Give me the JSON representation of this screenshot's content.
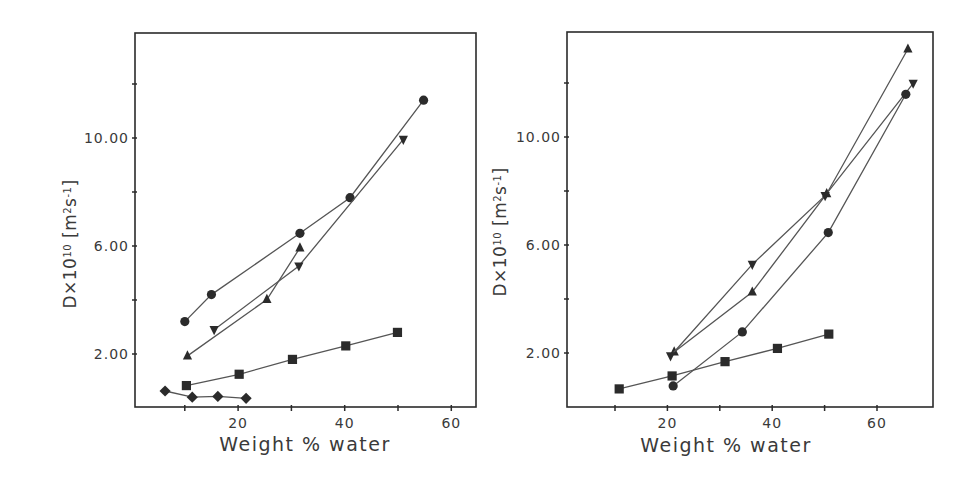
{
  "figure": {
    "panels": [
      "left",
      "right"
    ]
  },
  "chart_data": [
    {
      "type": "line",
      "panel": "left",
      "title": "",
      "xlabel": "Weight % water",
      "ylabel": "D×10^10 [m^2 s^-1]",
      "ylabel_parts": {
        "base": "D×10",
        "exp": "10",
        "unit_open": "[m",
        "unit_exp1": "2",
        "unit_mid": "s",
        "unit_exp2": "-1",
        "unit_close": "]"
      },
      "xlim": [
        0,
        65
      ],
      "ylim": [
        0,
        14
      ],
      "x_ticks": [
        10,
        20,
        30,
        40,
        50,
        60
      ],
      "x_tick_labels": [
        "",
        "20",
        "",
        "40",
        "",
        "60"
      ],
      "y_ticks": [
        2,
        4,
        6,
        8,
        10,
        12
      ],
      "y_tick_labels": [
        "2.00",
        "",
        "6.00",
        "",
        "10.00",
        ""
      ],
      "grid": false,
      "legend": null,
      "series": [
        {
          "name": "circle",
          "marker": "circle",
          "x": [
            10.0,
            15.0,
            31.6,
            41.0,
            54.8
          ],
          "y": [
            3.2,
            4.2,
            6.47,
            7.79,
            11.4
          ]
        },
        {
          "name": "triangle-down",
          "marker": "triangle-down",
          "x": [
            15.5,
            31.4,
            51.0
          ],
          "y": [
            2.9,
            5.26,
            9.95
          ]
        },
        {
          "name": "triangle-up",
          "marker": "triangle-up",
          "x": [
            10.5,
            25.4,
            31.6
          ],
          "y": [
            1.93,
            4.02,
            5.93
          ]
        },
        {
          "name": "square",
          "marker": "square",
          "x": [
            10.3,
            20.2,
            30.2,
            40.2,
            49.9
          ],
          "y": [
            0.83,
            1.25,
            1.8,
            2.3,
            2.8
          ]
        },
        {
          "name": "diamond",
          "marker": "diamond",
          "x": [
            6.3,
            11.4,
            16.2,
            21.5
          ],
          "y": [
            0.63,
            0.4,
            0.43,
            0.36
          ]
        }
      ]
    },
    {
      "type": "line",
      "panel": "right",
      "title": "",
      "xlabel": "Weight % water",
      "ylabel": "D×10^10 [m^2 s^-1]",
      "ylabel_parts": {
        "base": "D×10",
        "exp": "10",
        "unit_open": "[m",
        "unit_exp1": "2",
        "unit_mid": "s",
        "unit_exp2": "-1",
        "unit_close": "]"
      },
      "xlim": [
        0,
        70
      ],
      "ylim": [
        0,
        14
      ],
      "x_ticks": [
        10,
        20,
        30,
        40,
        50,
        60
      ],
      "x_tick_labels": [
        "",
        "20",
        "",
        "40",
        "",
        "60"
      ],
      "y_ticks": [
        2,
        4,
        6,
        8,
        10,
        12
      ],
      "y_tick_labels": [
        "2.00",
        "",
        "6.00",
        "",
        "10.00",
        ""
      ],
      "grid": false,
      "legend": null,
      "series": [
        {
          "name": "triangle-up",
          "marker": "triangle-up",
          "x": [
            21.3,
            36.2,
            50.4,
            65.9
          ],
          "y": [
            2.04,
            4.26,
            7.9,
            13.26
          ]
        },
        {
          "name": "triangle-down",
          "marker": "triangle-down",
          "x": [
            20.6,
            36.2,
            50.1,
            66.9
          ],
          "y": [
            1.89,
            5.28,
            7.83,
            11.99
          ]
        },
        {
          "name": "circle",
          "marker": "circle",
          "x": [
            21.1,
            34.3,
            50.7,
            65.5
          ],
          "y": [
            0.78,
            2.78,
            6.46,
            11.58
          ]
        },
        {
          "name": "square",
          "marker": "square",
          "x": [
            10.8,
            20.9,
            31.0,
            41.0,
            50.8
          ],
          "y": [
            0.67,
            1.15,
            1.68,
            2.17,
            2.7
          ]
        }
      ]
    }
  ],
  "layout": {
    "panels": [
      {
        "box": [
          135,
          33,
          476,
          407
        ],
        "x0_px": 131.5,
        "x_px_per_unit": 5.33,
        "y0_px": 408,
        "y_px_per_unit": 27.0,
        "ylabel_center": [
          70,
          244
        ],
        "xlabel_center": [
          305,
          451
        ],
        "xtick_label_y": 428
      },
      {
        "box": [
          567,
          32,
          933,
          407
        ],
        "x0_px": 562.6,
        "x_px_per_unit": 5.24,
        "y0_px": 407,
        "y_px_per_unit": 27.0,
        "ylabel_center": [
          500,
          232
        ],
        "xlabel_center": [
          726,
          452
        ],
        "xtick_label_y": 428
      }
    ],
    "colors": {
      "ink": "#2b2b2b",
      "line": "#555555",
      "background": "#ffffff"
    }
  }
}
